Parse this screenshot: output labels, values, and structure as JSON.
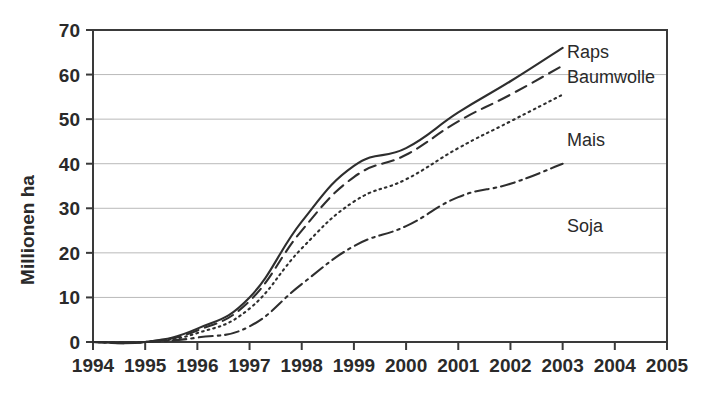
{
  "chart_data": {
    "type": "line",
    "title": "",
    "subtitle": "",
    "xlabel": "",
    "ylabel": "Millionen ha",
    "xlim": [
      1994,
      2005
    ],
    "ylim": [
      0,
      70
    ],
    "x_ticks": [
      1994,
      1995,
      1996,
      1997,
      1998,
      1999,
      2000,
      2001,
      2002,
      2003,
      2004,
      2005
    ],
    "y_ticks": [
      0,
      10,
      20,
      30,
      40,
      50,
      60,
      70
    ],
    "grid": "horizontal",
    "legend_position": "inline-right",
    "x": [
      1994,
      1995,
      1996,
      1997,
      1998,
      1999,
      2000,
      2001,
      2002,
      2003
    ],
    "series": [
      {
        "name": "Raps",
        "label": "Raps",
        "linestyle": "solid",
        "color": "#2e2e2e",
        "values": [
          0,
          0,
          3.0,
          10.0,
          27.0,
          39.5,
          43.5,
          51.5,
          58.5,
          66.0
        ]
      },
      {
        "name": "Baumwolle",
        "label": "Baumwolle",
        "linestyle": "dashed",
        "color": "#2e2e2e",
        "values": [
          0,
          0,
          2.6,
          9.2,
          25.0,
          37.0,
          42.0,
          49.5,
          55.5,
          62.0
        ]
      },
      {
        "name": "Mais",
        "label": "Mais",
        "linestyle": "dotted",
        "color": "#2e2e2e",
        "values": [
          0,
          0,
          2.0,
          7.5,
          21.0,
          31.5,
          36.5,
          43.5,
          49.5,
          55.5
        ]
      },
      {
        "name": "Soja",
        "label": "Soja",
        "linestyle": "dashdot",
        "color": "#2e2e2e",
        "values": [
          0,
          0,
          1.0,
          3.5,
          13.0,
          21.5,
          26.0,
          32.5,
          35.5,
          40.0
        ]
      }
    ],
    "annotations": [
      {
        "text": "Raps",
        "near_series": "Raps"
      },
      {
        "text": "Baumwolle",
        "near_series": "Baumwolle"
      },
      {
        "text": "Mais",
        "near_series": "Mais"
      },
      {
        "text": "Soja",
        "near_series": "Soja"
      }
    ]
  },
  "axis": {
    "y_title": "Millionen ha",
    "y_tick_labels": [
      "0",
      "10",
      "20",
      "30",
      "40",
      "50",
      "60",
      "70"
    ],
    "x_tick_labels": [
      "1994",
      "1995",
      "1996",
      "1997",
      "1998",
      "1999",
      "2000",
      "2001",
      "2002",
      "2003",
      "2004",
      "2005"
    ]
  },
  "labels": {
    "raps": "Raps",
    "baumwolle": "Baumwolle",
    "mais": "Mais",
    "soja": "Soja"
  },
  "colors": {
    "line": "#2e2e2e",
    "grid": "#b9b9b9",
    "axis": "#3a3a3a",
    "text": "#2a2a2a",
    "background": "#ffffff"
  }
}
